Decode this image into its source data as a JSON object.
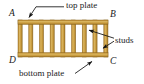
{
  "figure": {
    "name": "wall-frame-diagram",
    "background_color": "#ffffff",
    "colors": {
      "wood_fill": "#c89a3c",
      "wood_fill_light": "#d9b45e",
      "wood_edge": "#8a6520",
      "line": "#111111",
      "text": "#1a1a1a"
    }
  },
  "corner_labels": {
    "a": "A",
    "b": "B",
    "c": "C",
    "d": "D"
  },
  "annotations": {
    "top_plate": "top plate",
    "studs": "studs",
    "bottom_plate": "bottom plate"
  },
  "geometry": {
    "frame": {
      "x": 18,
      "y": 20,
      "width": 90,
      "height": 37,
      "member_thickness": 4
    },
    "bays": 8,
    "stud_count": 7,
    "leaders": [
      {
        "name": "top-plate-leader",
        "from_x": 64,
        "from_y": 7,
        "to_x": 29,
        "to_y": 18,
        "arrow": true
      },
      {
        "name": "studs-leader-upper",
        "from_x": 114,
        "from_y": 38,
        "to_x": 90,
        "to_y": 30,
        "arrow": true
      },
      {
        "name": "studs-leader-lower",
        "from_x": 114,
        "from_y": 42,
        "to_x": 104,
        "to_y": 48,
        "arrow": true
      },
      {
        "name": "bottom-plate-leader",
        "from_x": 76,
        "from_y": 74,
        "to_x": 92,
        "to_y": 62,
        "arrow": true
      }
    ]
  }
}
